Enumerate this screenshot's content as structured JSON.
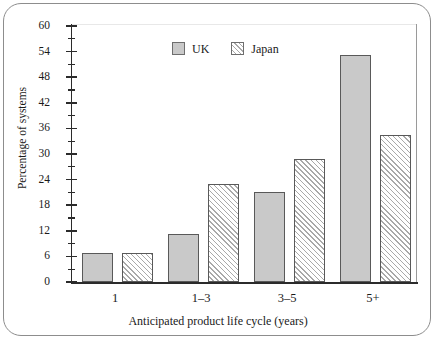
{
  "chart_data": {
    "type": "bar",
    "title": "",
    "xlabel": "Anticipated product life cycle (years)",
    "ylabel": "Percentage of systems",
    "categories": [
      "1",
      "1–3",
      "3–5",
      "5+"
    ],
    "series": [
      {
        "name": "UK",
        "values": [
          6.8,
          11.2,
          21.0,
          53.2
        ],
        "color": "#c9c9c9",
        "fill": "solid"
      },
      {
        "name": "Japan",
        "values": [
          6.7,
          23.0,
          28.8,
          34.5
        ],
        "color": "#a9a9a9",
        "fill": "diagonal-hatch"
      }
    ],
    "ylim": [
      0,
      60
    ],
    "ytick_values": [
      0,
      6,
      12,
      18,
      24,
      30,
      36,
      42,
      48,
      54,
      60
    ],
    "ytick_labels": [
      "0",
      "6",
      "12",
      "18",
      "24",
      "30",
      "36",
      "42",
      "48",
      "54",
      "60"
    ],
    "yminor_values": [
      3,
      9,
      15,
      21,
      27,
      33,
      39,
      45,
      51,
      57
    ],
    "grid": false,
    "legend_position": "top-center",
    "legend_entries": [
      "UK",
      "Japan"
    ]
  },
  "legend": {
    "items": [
      {
        "label": "UK"
      },
      {
        "label": "Japan"
      }
    ]
  },
  "axes": {
    "y_title": "Percentage of systems",
    "x_title": "Anticipated product life cycle (years)"
  }
}
